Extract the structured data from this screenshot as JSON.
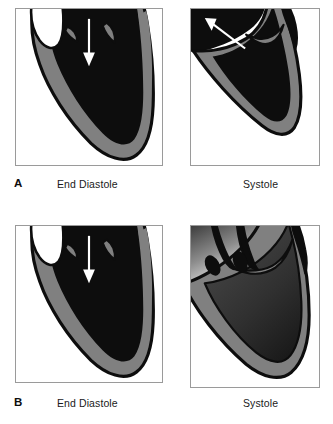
{
  "figure": {
    "colors": {
      "chamber_blood": "#0d0d0d",
      "myocardium_wall": "#808080",
      "outline": "#0d0d0d",
      "arrow": "#ffffff",
      "panel_border": "#9a9a9a",
      "background": "#ffffff"
    },
    "rows": [
      {
        "letter": "A",
        "left_caption": "End Diastole",
        "right_caption": "Systole",
        "left_panel": {
          "name": "normal-heart-end-diastole",
          "arrow_direction": "down",
          "arrow_label": "inflow"
        },
        "right_panel": {
          "name": "normal-heart-systole",
          "arrow_direction": "up-left",
          "arrow_label": "ejection"
        }
      },
      {
        "letter": "B",
        "left_caption": "End Diastole",
        "right_caption": "Systole",
        "left_panel": {
          "name": "dilated-heart-end-diastole",
          "arrow_direction": "down",
          "arrow_label": "inflow"
        },
        "right_panel": {
          "name": "dilated-heart-systole",
          "arrow_direction": "none",
          "arrow_label": ""
        }
      }
    ]
  }
}
